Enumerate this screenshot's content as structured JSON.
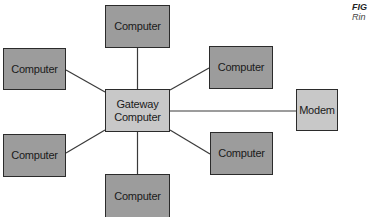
{
  "diagram": {
    "colors": {
      "computer_fill": "#9c9c9c",
      "hub_fill": "#c8c8c8",
      "border": "#2b2b2b",
      "line": "#3a3a3a",
      "background": "#ffffff"
    },
    "hub": {
      "label": "Gateway Computer",
      "line1": "Gateway",
      "line2": "Computer"
    },
    "nodes": [
      {
        "id": "computer-top",
        "label": "Computer"
      },
      {
        "id": "computer-left-top",
        "label": "Computer"
      },
      {
        "id": "computer-right-top",
        "label": "Computer"
      },
      {
        "id": "computer-left-bottom",
        "label": "Computer"
      },
      {
        "id": "computer-right-bottom",
        "label": "Computer"
      },
      {
        "id": "computer-bottom",
        "label": "Computer"
      },
      {
        "id": "modem",
        "label": "Modem"
      }
    ],
    "edges": [
      {
        "from": "Gateway Computer",
        "to": "computer-top"
      },
      {
        "from": "Gateway Computer",
        "to": "computer-left-top"
      },
      {
        "from": "Gateway Computer",
        "to": "computer-right-top"
      },
      {
        "from": "Gateway Computer",
        "to": "computer-left-bottom"
      },
      {
        "from": "Gateway Computer",
        "to": "computer-right-bottom"
      },
      {
        "from": "Gateway Computer",
        "to": "computer-bottom"
      },
      {
        "from": "Gateway Computer",
        "to": "modem"
      }
    ],
    "caption": {
      "fig": "FIG",
      "text": "Rin"
    }
  }
}
